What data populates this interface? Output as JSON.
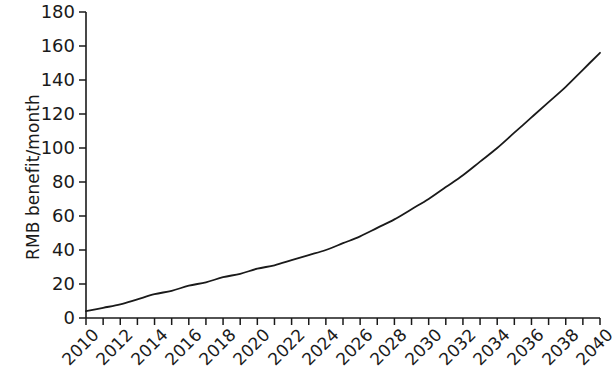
{
  "chart_data": {
    "type": "line",
    "title": "",
    "subtitle": "",
    "xlabel": "",
    "ylabel": "RMB benefit/month",
    "xlim": [
      2010,
      2040
    ],
    "ylim": [
      0,
      180
    ],
    "y_ticks": [
      0,
      20,
      40,
      60,
      80,
      100,
      120,
      140,
      160,
      180
    ],
    "y_tick_labels": [
      "0",
      "20",
      "40",
      "60",
      "80",
      "100",
      "120",
      "140",
      "160",
      "180"
    ],
    "x_ticks": [
      2010,
      2011,
      2012,
      2013,
      2014,
      2015,
      2016,
      2017,
      2018,
      2019,
      2020,
      2021,
      2022,
      2023,
      2024,
      2025,
      2026,
      2027,
      2028,
      2029,
      2030,
      2031,
      2032,
      2033,
      2034,
      2035,
      2036,
      2037,
      2038,
      2039,
      2040
    ],
    "x_tick_labels": [
      "2010",
      "2012",
      "2014",
      "2016",
      "2018",
      "2020",
      "2022",
      "2024",
      "2026",
      "2028",
      "2030",
      "2032",
      "2034",
      "2036",
      "2038",
      "2040"
    ],
    "x_tick_label_years": [
      2010,
      2012,
      2014,
      2016,
      2018,
      2020,
      2022,
      2024,
      2026,
      2028,
      2030,
      2032,
      2034,
      2036,
      2038,
      2040
    ],
    "x_tick_label_rotation": -45,
    "grid": false,
    "legend": false,
    "legend_position": "none",
    "line_color": "#1a1a1a",
    "line_width": 1.8,
    "series": [
      {
        "name": "RMB benefit/month",
        "x": [
          2010,
          2011,
          2012,
          2013,
          2014,
          2015,
          2016,
          2017,
          2018,
          2019,
          2020,
          2021,
          2022,
          2023,
          2024,
          2025,
          2026,
          2027,
          2028,
          2029,
          2030,
          2031,
          2032,
          2033,
          2034,
          2035,
          2036,
          2037,
          2038,
          2039,
          2040
        ],
        "values": [
          4,
          6,
          8,
          11,
          14,
          16,
          19,
          21,
          24,
          26,
          29,
          31,
          34,
          37,
          40,
          44,
          48,
          53,
          58,
          64,
          70,
          77,
          84,
          92,
          100,
          109,
          118,
          127,
          136,
          146,
          156
        ]
      }
    ]
  },
  "axes": {
    "y_axis_title": "RMB benefit/month"
  }
}
